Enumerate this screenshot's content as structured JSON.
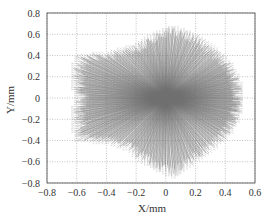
{
  "chart_data": {
    "type": "scatter",
    "subtype": "vector-field-starburst",
    "title": "",
    "xlabel": "X/mm",
    "ylabel": "Y/mm",
    "xlim": [
      -0.8,
      0.6
    ],
    "ylim": [
      -0.8,
      0.8
    ],
    "xticks": [
      -0.8,
      -0.6,
      -0.4,
      -0.2,
      0,
      0.2,
      0.4,
      0.6
    ],
    "yticks": [
      -0.8,
      -0.6,
      -0.4,
      -0.2,
      0,
      0.2,
      0.4,
      0.6,
      0.8
    ],
    "xtick_labels": [
      "−0.8",
      "−0.6",
      "−0.4",
      "−0.2",
      "0",
      "0.2",
      "0.4",
      "0.6"
    ],
    "ytick_labels": [
      "−0.8",
      "−0.6",
      "−0.4",
      "−0.2",
      "0",
      "0.2",
      "0.4",
      "0.6",
      "0.8"
    ],
    "grid": true,
    "grid_style": "dotted",
    "legend": null,
    "center": [
      0,
      0
    ],
    "envelope": [
      [
        -0.6,
        0.4
      ],
      [
        -0.4,
        0.42
      ],
      [
        -0.2,
        0.5
      ],
      [
        0.0,
        0.66
      ],
      [
        0.05,
        0.68
      ],
      [
        0.2,
        0.6
      ],
      [
        0.35,
        0.45
      ],
      [
        0.45,
        0.3
      ],
      [
        0.5,
        0.15
      ],
      [
        0.52,
        0.0
      ],
      [
        0.5,
        -0.15
      ],
      [
        0.45,
        -0.3
      ],
      [
        0.35,
        -0.45
      ],
      [
        0.2,
        -0.6
      ],
      [
        0.05,
        -0.75
      ],
      [
        -0.1,
        -0.65
      ],
      [
        -0.25,
        -0.5
      ],
      [
        -0.4,
        -0.42
      ],
      [
        -0.6,
        -0.4
      ],
      [
        -0.6,
        0.0
      ]
    ],
    "line_color": "#6e6e6e",
    "ray_count": 360
  },
  "labels": {
    "xlabel": "X/mm",
    "ylabel": "Y/mm"
  }
}
